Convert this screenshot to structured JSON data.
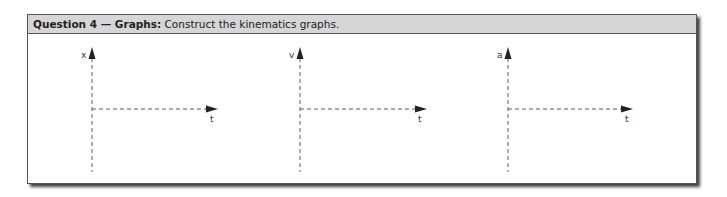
{
  "question": {
    "number_label": "Question 4 — Graphs:",
    "prompt": "Construct the kinematics graphs."
  },
  "graphs": [
    {
      "name": "position-time",
      "y_label": "x",
      "x_label": "t"
    },
    {
      "name": "velocity-time",
      "y_label": "v",
      "x_label": "t"
    },
    {
      "name": "acceleration-time",
      "y_label": "a",
      "x_label": "t"
    }
  ],
  "colors": {
    "header_bg": "#d6d6d6",
    "border": "#555555",
    "axis": "#333333"
  }
}
